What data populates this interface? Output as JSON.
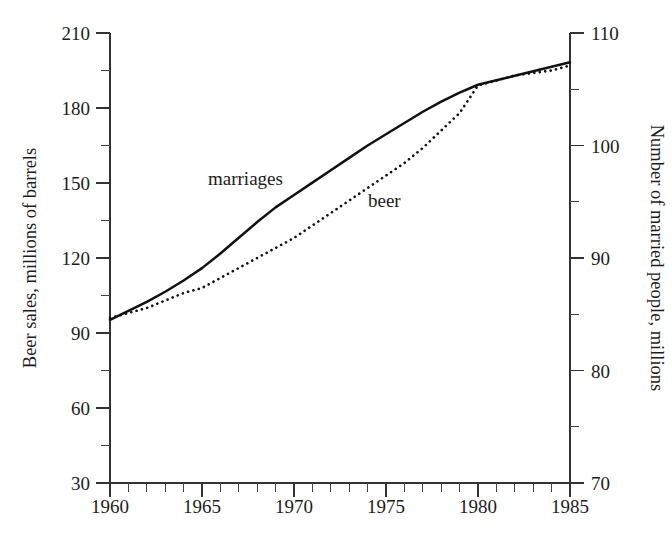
{
  "chart_data": {
    "type": "line",
    "title": "",
    "subtitle": "",
    "xlabel": "",
    "ylabel": "Beer sales, millions of barrels",
    "y2label": "Number of married people, millions",
    "xlim": [
      1960,
      1985
    ],
    "ylim": [
      30,
      210
    ],
    "y2lim": [
      70,
      110
    ],
    "grid": false,
    "legend_position": "inline-annotations",
    "x_ticks": [
      1960,
      1965,
      1970,
      1975,
      1980,
      1985
    ],
    "x_tick_labels": [
      "1960",
      "1965",
      "1970",
      "1975",
      "1980",
      "1985"
    ],
    "x_minor_tick_interval": 1,
    "y_ticks": [
      30,
      60,
      90,
      120,
      150,
      180,
      210
    ],
    "y_tick_labels": [
      "30",
      "60",
      "90",
      "120",
      "150",
      "180",
      "210"
    ],
    "y_minor_tick_interval": 15,
    "y2_ticks": [
      70,
      80,
      90,
      100,
      110
    ],
    "y2_tick_labels": [
      "70",
      "80",
      "90",
      "100",
      "110"
    ],
    "y2_minor_tick_interval": 5,
    "annotations": [
      {
        "text": "marriages",
        "x": 1969.0,
        "y_axis": "right",
        "value": 98.5
      },
      {
        "text": "beer",
        "x": 1975.0,
        "y_axis": "left",
        "value": 142.0
      }
    ],
    "series": [
      {
        "name": "beer",
        "label": "beer",
        "axis": "left",
        "style": "dotted",
        "color": "#111111",
        "unit": "millions of barrels",
        "x": [
          1960,
          1961,
          1962,
          1963,
          1964,
          1965,
          1966,
          1967,
          1968,
          1969,
          1970,
          1971,
          1972,
          1973,
          1974,
          1975,
          1976,
          1977,
          1978,
          1979,
          1980,
          1981,
          1982,
          1983,
          1984,
          1985
        ],
        "values": [
          96,
          98,
          100,
          103,
          106,
          108,
          112,
          116,
          120,
          124,
          128,
          133,
          138,
          143,
          148,
          153,
          158,
          164,
          171,
          178,
          189,
          191,
          193,
          194,
          195,
          197
        ]
      },
      {
        "name": "marriages",
        "label": "marriages",
        "axis": "right",
        "style": "solid",
        "color": "#111111",
        "unit": "millions",
        "x": [
          1960,
          1961,
          1962,
          1963,
          1964,
          1965,
          1966,
          1967,
          1968,
          1969,
          1970,
          1971,
          1972,
          1973,
          1974,
          1975,
          1976,
          1977,
          1978,
          1979,
          1980,
          1981,
          1982,
          1983,
          1984,
          1985
        ],
        "values": [
          84.5,
          85.3,
          86.1,
          87.0,
          88.0,
          89.1,
          90.4,
          91.8,
          93.2,
          94.5,
          95.6,
          96.7,
          97.8,
          98.9,
          100.0,
          101.0,
          102.0,
          103.0,
          103.9,
          104.7,
          105.4,
          105.8,
          106.2,
          106.6,
          107.0,
          107.4
        ]
      }
    ]
  },
  "axes": {
    "left_title": "Beer sales, millions of barrels",
    "right_title": "Number of married people, millions"
  }
}
